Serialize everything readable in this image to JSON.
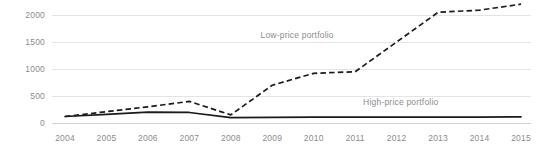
{
  "chart_data": {
    "type": "line",
    "title": "",
    "xlabel": "",
    "ylabel": "",
    "grid": true,
    "legend_position": "inline-annotation",
    "categories": [
      "2004",
      "2005",
      "2006",
      "2007",
      "2008",
      "2009",
      "2010",
      "2011",
      "2012",
      "2013",
      "2014",
      "2015"
    ],
    "ylim": [
      0,
      2300
    ],
    "yticks": [
      0,
      500,
      1000,
      1500,
      2000
    ],
    "ytick_labels": [
      "0",
      "500",
      "1000",
      "1500",
      "2000"
    ],
    "series": [
      {
        "name": "Low-price portfolio",
        "style": "dashed",
        "color": "#1a1a1a",
        "values": [
          120,
          210,
          300,
          400,
          150,
          700,
          920,
          950,
          1500,
          2050,
          2090,
          2200
        ]
      },
      {
        "name": "High-price portfolio",
        "style": "solid",
        "color": "#1a1a1a",
        "values": [
          120,
          160,
          200,
          195,
          100,
          105,
          110,
          110,
          110,
          110,
          110,
          115
        ]
      }
    ],
    "annotations": [
      {
        "text": "Low-price portfolio",
        "x_value": 2009.6,
        "y_value": 1580
      },
      {
        "text": "High-price portfolio",
        "x_value": 2012.1,
        "y_value": 330
      }
    ]
  }
}
